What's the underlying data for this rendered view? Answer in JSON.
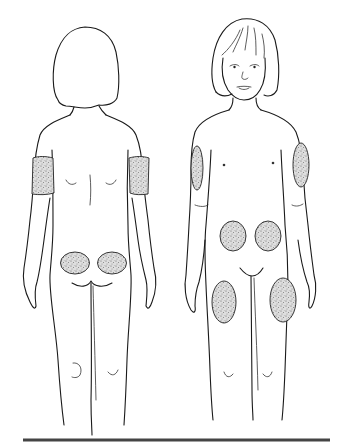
{
  "diagram": {
    "type": "illustration",
    "colors": {
      "background": "#ffffff",
      "line": "#1a1a1a",
      "site_fill": "#d9d9d9",
      "site_stipple": "#6a6a6a",
      "base_rule": "#444444"
    },
    "figures": [
      {
        "view": "back",
        "sites": [
          {
            "name": "left-upper-arm-back",
            "shape": "band"
          },
          {
            "name": "right-upper-arm-back",
            "shape": "band"
          },
          {
            "name": "left-buttock",
            "shape": "oval"
          },
          {
            "name": "right-buttock",
            "shape": "oval"
          }
        ]
      },
      {
        "view": "front",
        "sites": [
          {
            "name": "right-upper-arm-outer",
            "shape": "oval"
          },
          {
            "name": "left-upper-arm-outer",
            "shape": "oval"
          },
          {
            "name": "abdomen-right",
            "shape": "oval"
          },
          {
            "name": "abdomen-left",
            "shape": "oval"
          },
          {
            "name": "right-thigh",
            "shape": "oval"
          },
          {
            "name": "left-thigh",
            "shape": "oval"
          }
        ]
      }
    ]
  }
}
